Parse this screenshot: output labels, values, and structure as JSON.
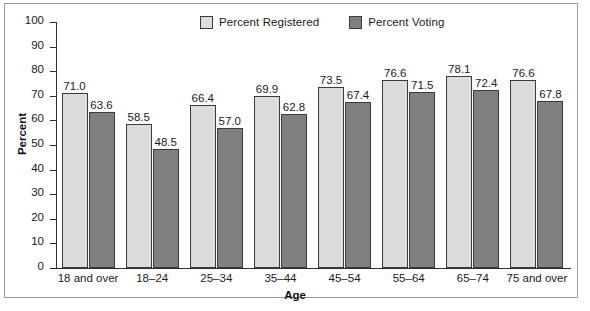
{
  "chart_data": {
    "type": "bar",
    "title": "",
    "subtitle": "",
    "xlabel": "Age",
    "ylabel": "Percent",
    "ylim": [
      0,
      100
    ],
    "ytick_step": 10,
    "yticks": [
      0,
      10,
      20,
      30,
      40,
      50,
      60,
      70,
      80,
      90,
      100
    ],
    "grid": false,
    "legend_position": "top-center",
    "categories": [
      "18 and over",
      "18–24",
      "25–34",
      "35–44",
      "45–54",
      "55–64",
      "65–74",
      "75 and over"
    ],
    "series": [
      {
        "name": "Percent Registered",
        "color": "#dcdcdc",
        "values": [
          71.0,
          58.5,
          66.4,
          69.9,
          73.5,
          76.6,
          78.1,
          76.6
        ],
        "labels": [
          "71.0",
          "58.5",
          "66.4",
          "69.9",
          "73.5",
          "76.6",
          "78.1",
          "76.6"
        ]
      },
      {
        "name": "Percent Voting",
        "color": "#808080",
        "values": [
          63.6,
          48.5,
          57.0,
          62.8,
          67.4,
          71.5,
          72.4,
          67.8
        ],
        "labels": [
          "63.6",
          "48.5",
          "57.0",
          "62.8",
          "67.4",
          "71.5",
          "72.4",
          "67.8"
        ]
      }
    ]
  },
  "axis": {
    "ytick_labels": [
      "100",
      "90",
      "80",
      "70",
      "60",
      "50",
      "40",
      "30",
      "20",
      "10",
      "0"
    ],
    "ylabel": "Percent",
    "xlabel": "Age"
  },
  "legend": {
    "items": [
      {
        "label": "Percent Registered",
        "swatch": "#dcdcdc"
      },
      {
        "label": "Percent Voting",
        "swatch": "#808080"
      }
    ]
  },
  "colors": {
    "registered": "#dcdcdc",
    "voting": "#808080",
    "axis": "#2e2e2e",
    "frame": "#9a9a9a",
    "text": "#1a1a1a"
  }
}
